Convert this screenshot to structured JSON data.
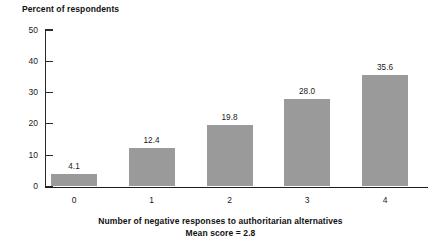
{
  "chart_data": {
    "type": "bar",
    "title": "",
    "ylabel": "Percent of respondents",
    "xlabel": "Number of negative responses to authoritarian alternatives",
    "annotation": "Mean score = 2.8",
    "categories": [
      "0",
      "1",
      "2",
      "3",
      "4"
    ],
    "values": [
      4.1,
      12.4,
      19.8,
      28.0,
      35.6
    ],
    "value_labels": [
      "4.1",
      "12.4",
      "19.8",
      "28.0",
      "35.6"
    ],
    "ylim": [
      0,
      50
    ],
    "yticks": [
      0,
      10,
      20,
      30,
      40,
      50
    ],
    "ytick_labels": [
      "0",
      "10",
      "20",
      "30",
      "40",
      "50"
    ],
    "grid": false,
    "legend": false,
    "bar_color": "#9a9a9a",
    "axis_color": "#1d1d1d"
  }
}
